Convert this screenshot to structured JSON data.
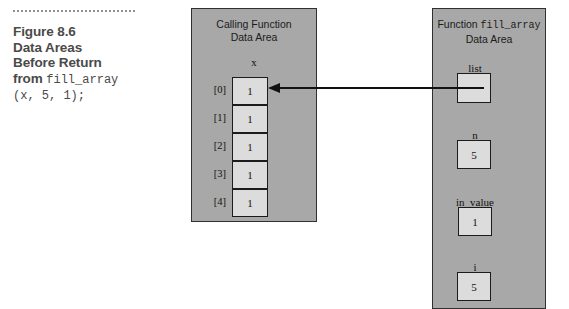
{
  "figure": {
    "caption": {
      "line1": "Figure 8.6",
      "line2": "Data Areas",
      "line3": "Before Return",
      "line4_prefix": "from ",
      "line4_code": "fill_array",
      "line5_code": "(x, 5, 1);"
    }
  },
  "calling_function_panel": {
    "title_line1": "Calling Function",
    "title_line2": "Data Area",
    "array_name": "x",
    "cells": [
      {
        "index_label": "[0]",
        "value": "1"
      },
      {
        "index_label": "[1]",
        "value": "1"
      },
      {
        "index_label": "[2]",
        "value": "1"
      },
      {
        "index_label": "[3]",
        "value": "1"
      },
      {
        "index_label": "[4]",
        "value": "1"
      }
    ]
  },
  "fill_array_panel": {
    "title_prefix": "Function ",
    "title_function_name": "fill_array",
    "title_line2": "Data Area",
    "variables": [
      {
        "name": "list",
        "value": ""
      },
      {
        "name": "n",
        "value": "5"
      },
      {
        "name": "in_value",
        "value": "1"
      },
      {
        "name": "i",
        "value": "5"
      }
    ]
  },
  "arrow": {
    "name": "list-points-to-x0",
    "direction": "right-to-left",
    "from": "list",
    "to": "x[0]"
  },
  "colors": {
    "panel_fill": "#a8a8a8",
    "panel_border": "#303030",
    "box_fill": "#dcdcdc",
    "box_border": "#1b1b1b",
    "caption_text": "#4a4a4a",
    "page_background": "#ffffff"
  }
}
